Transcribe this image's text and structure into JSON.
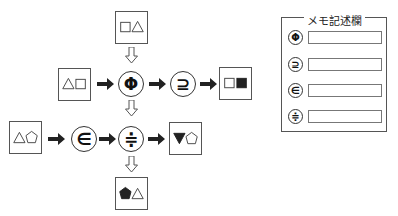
{
  "diagram": {
    "boxes": {
      "top": {
        "shapes": [
          "white-square",
          "white-triangle"
        ]
      },
      "left_mid": {
        "shapes": [
          "white-triangle",
          "white-square"
        ]
      },
      "right_mid": {
        "shapes": [
          "white-square",
          "black-square"
        ]
      },
      "left_bottom": {
        "shapes": [
          "white-triangle",
          "white-pentagon"
        ]
      },
      "right_bottom": {
        "shapes": [
          "black-inverted-triangle",
          "white-pentagon"
        ]
      },
      "bottom": {
        "shapes": [
          "black-pentagon",
          "white-triangle"
        ]
      }
    },
    "operators": {
      "phi": "Φ",
      "superset_eq": "⊇",
      "element_of": "∈",
      "approx_equal": "≑"
    },
    "flows": [
      {
        "from": "top",
        "to": "phi",
        "style": "hollow-arrow"
      },
      {
        "from": "left_mid",
        "to": "phi",
        "style": "solid-arrow"
      },
      {
        "from": "phi",
        "to": "superset_eq",
        "style": "solid-arrow"
      },
      {
        "from": "superset_eq",
        "to": "right_mid",
        "style": "solid-arrow"
      },
      {
        "from": "phi",
        "to": "approx_equal",
        "style": "hollow-arrow"
      },
      {
        "from": "left_bottom",
        "to": "element_of",
        "style": "solid-arrow"
      },
      {
        "from": "element_of",
        "to": "approx_equal",
        "style": "solid-arrow"
      },
      {
        "from": "approx_equal",
        "to": "right_bottom",
        "style": "solid-arrow"
      },
      {
        "from": "approx_equal",
        "to": "bottom",
        "style": "hollow-arrow"
      }
    ]
  },
  "memo": {
    "title": "メモ記述欄",
    "rows": [
      {
        "symbol": "Φ",
        "value": ""
      },
      {
        "symbol": "⊇",
        "value": ""
      },
      {
        "symbol": "∈",
        "value": ""
      },
      {
        "symbol": "≑",
        "value": ""
      }
    ]
  }
}
